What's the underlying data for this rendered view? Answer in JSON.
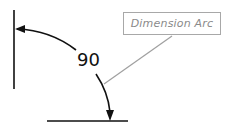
{
  "diagram": {
    "angle_value": "90",
    "callout_label": "Dimension Arc",
    "colors": {
      "lines": "#111111",
      "leader": "#a0a0a0",
      "callout_border": "#a8a8a8",
      "callout_text": "#8a8a8a"
    }
  }
}
